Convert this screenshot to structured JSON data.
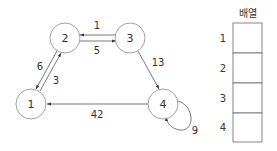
{
  "graph": {
    "nodes": [
      {
        "id": "1",
        "label": "1",
        "cx": 31,
        "cy": 104
      },
      {
        "id": "2",
        "label": "2",
        "cx": 65,
        "cy": 38
      },
      {
        "id": "3",
        "label": "3",
        "cx": 130,
        "cy": 38
      },
      {
        "id": "4",
        "label": "4",
        "cx": 163,
        "cy": 104
      }
    ],
    "edges": [
      {
        "from": "3",
        "to": "2",
        "weight": "1"
      },
      {
        "from": "2",
        "to": "3",
        "weight": "5"
      },
      {
        "from": "2",
        "to": "1",
        "weight": "6"
      },
      {
        "from": "1",
        "to": "2",
        "weight": "3"
      },
      {
        "from": "3",
        "to": "4",
        "weight": "13"
      },
      {
        "from": "4",
        "to": "1",
        "weight": "42"
      },
      {
        "from": "4",
        "to": "4",
        "weight": "9"
      }
    ]
  },
  "array": {
    "title": "배열",
    "rows": [
      {
        "index": "1",
        "value": ""
      },
      {
        "index": "2",
        "value": ""
      },
      {
        "index": "3",
        "value": ""
      },
      {
        "index": "4",
        "value": ""
      }
    ]
  }
}
